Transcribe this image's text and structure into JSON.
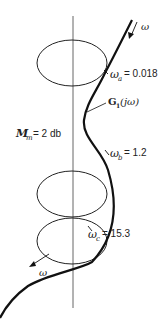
{
  "diagram": {
    "type": "polar_plot_with_M_circles",
    "curve_label": "G",
    "curve_label_sub": "1",
    "curve_label_arg": "(jω)",
    "mm_label_main": "M",
    "mm_label_sub": "m",
    "mm_value": "= 2 db",
    "omega_symbol": "ω",
    "points": [
      {
        "name": "a",
        "sub": "a",
        "value": "= 0.018"
      },
      {
        "name": "b",
        "sub": "b",
        "value": "= 1.2"
      },
      {
        "name": "c",
        "sub": "c",
        "value": "= 15.3"
      }
    ],
    "direction_arrows": [
      {
        "label": "ω",
        "position": "top"
      },
      {
        "label": "ω",
        "position": "bottom"
      }
    ],
    "colors": {
      "line": "#1a1a1a",
      "axis": "#555555",
      "background": "#ffffff"
    }
  }
}
